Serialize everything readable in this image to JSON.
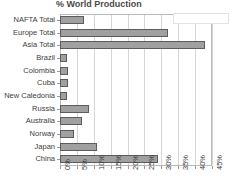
{
  "chart_data": {
    "type": "bar",
    "orientation": "horizontal",
    "title": "% World Production",
    "xlabel": "",
    "ylabel": "",
    "xlim": [
      0,
      45
    ],
    "grid": true,
    "legend_position": "top-right",
    "categories": [
      "NAFTA Total",
      "Europe Total",
      "Asia Total",
      "Brazil",
      "Colombia",
      "Cuba",
      "New Caledonia",
      "Russia",
      "Australia",
      "Norway",
      "Japan",
      "China"
    ],
    "values": [
      7,
      32,
      43,
      2,
      2.5,
      2.5,
      2,
      8.5,
      6.5,
      4,
      11,
      29
    ],
    "tick_labels": [
      "0%",
      "5%",
      "10%",
      "15%",
      "20%",
      "25%",
      "30%",
      "35%",
      "40%",
      "45%"
    ],
    "tick_values": [
      0,
      5,
      10,
      15,
      20,
      25,
      30,
      35,
      40,
      45
    ],
    "bar_color": "#a0a0a0",
    "bar_border_color": "#5c5c5c",
    "grid_color": "#d6d6d6",
    "axis_color": "#b9b9b9",
    "legend_label": ""
  }
}
